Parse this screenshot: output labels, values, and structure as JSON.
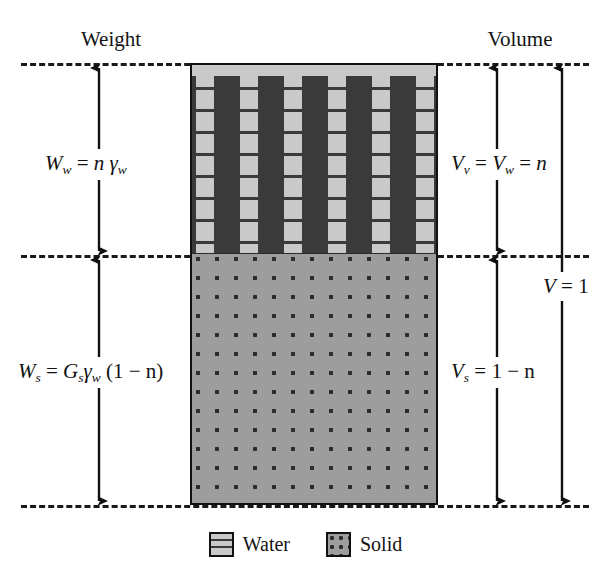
{
  "figure": {
    "type": "soil-phase-diagram"
  },
  "headers": {
    "left": "Weight",
    "right": "Volume"
  },
  "phases": [
    {
      "id": "water",
      "name": "Water",
      "fill_color": "#c9c9c9",
      "hatch": "horizontal-dashes",
      "height_fraction": 0.43
    },
    {
      "id": "solid",
      "name": "Solid",
      "fill_color": "#9d9d9d",
      "hatch": "dot-grid",
      "height_fraction": 0.57
    }
  ],
  "equations": {
    "weight_water": {
      "lhs": "W",
      "lhs_sub": "w",
      "text": "Ww = nγw",
      "parts": [
        {
          "kind": "var",
          "text": "W",
          "sub": "w"
        },
        {
          "kind": "op",
          "text": "="
        },
        {
          "kind": "var",
          "text": "n"
        },
        {
          "kind": "var",
          "text": "γ",
          "sub": "w"
        }
      ]
    },
    "weight_solid": {
      "lhs": "W",
      "lhs_sub": "s",
      "text": "Ws = Gsγw(1 − n)",
      "parts": [
        {
          "kind": "var",
          "text": "W",
          "sub": "s"
        },
        {
          "kind": "op",
          "text": "="
        },
        {
          "kind": "var",
          "text": "G",
          "sub": "s"
        },
        {
          "kind": "var",
          "text": "γ",
          "sub": "w"
        },
        {
          "kind": "op",
          "text": "(1 − n)"
        }
      ]
    },
    "volume_voids": {
      "text": "Vv = Vw = n",
      "parts": [
        {
          "kind": "var",
          "text": "V",
          "sub": "v"
        },
        {
          "kind": "op",
          "text": "="
        },
        {
          "kind": "var",
          "text": "V",
          "sub": "w"
        },
        {
          "kind": "op",
          "text": "="
        },
        {
          "kind": "var",
          "text": "n"
        }
      ]
    },
    "volume_solid": {
      "text": "Vs = 1 − n",
      "parts": [
        {
          "kind": "var",
          "text": "V",
          "sub": "s"
        },
        {
          "kind": "op",
          "text": "="
        },
        {
          "kind": "op",
          "text": "1 − n"
        }
      ]
    },
    "volume_total": {
      "text": "V = 1",
      "parts": [
        {
          "kind": "var",
          "text": "V"
        },
        {
          "kind": "op",
          "text": "="
        },
        {
          "kind": "op",
          "text": "1"
        }
      ]
    }
  },
  "legend": {
    "items": [
      {
        "label": "Water",
        "swatch": "water-hatch-swatch"
      },
      {
        "label": "Solid",
        "swatch": "solid-dot-swatch"
      }
    ]
  },
  "colors": {
    "water_fill": "#c9c9c9",
    "solid_fill": "#9d9d9d",
    "hatch": "#3a3a3a",
    "outline": "#111111",
    "dash_rule": "#1a1a1a",
    "background": "#ffffff"
  },
  "dimension_arrows": [
    {
      "name": "Ww",
      "side": "left",
      "from": "top-rule",
      "to": "mid-rule"
    },
    {
      "name": "Ws",
      "side": "left",
      "from": "mid-rule",
      "to": "bottom-rule"
    },
    {
      "name": "Vv",
      "side": "right",
      "from": "top-rule",
      "to": "mid-rule"
    },
    {
      "name": "Vs",
      "side": "right",
      "from": "mid-rule",
      "to": "bottom-rule"
    },
    {
      "name": "V",
      "side": "right",
      "from": "top-rule",
      "to": "bottom-rule"
    }
  ]
}
